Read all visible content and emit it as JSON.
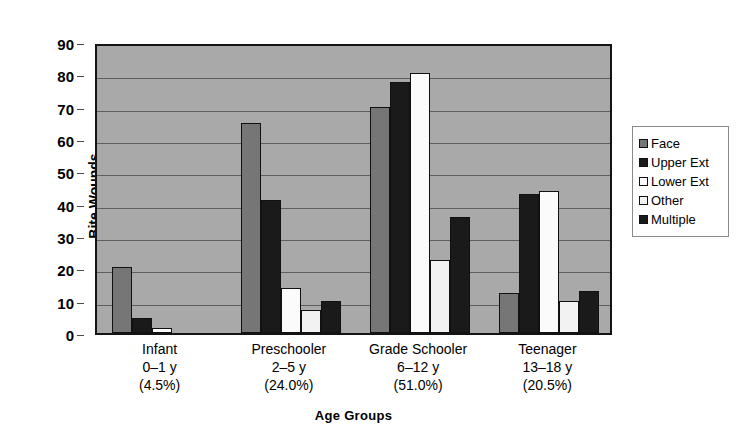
{
  "chart_data": {
    "type": "bar",
    "title": "",
    "xlabel": "Age Groups",
    "ylabel": "Bite Wounds",
    "ylim": [
      0,
      90
    ],
    "ytick_step": 10,
    "yticks": [
      90,
      80,
      70,
      60,
      50,
      40,
      30,
      20,
      10,
      0
    ],
    "grid": true,
    "legend_position": "right",
    "categories": [
      "Infant\n0–1 y\n(4.5%)",
      "Preschooler\n2–5 y\n(24.0%)",
      "Grade Schooler\n6–12 y\n(51.0%)",
      "Teenager\n13–18 y\n(20.5%)"
    ],
    "category_lines": [
      [
        "Infant",
        "0–1 y",
        "(4.5%)"
      ],
      [
        "Preschooler",
        "2–5 y",
        "(24.0%)"
      ],
      [
        "Grade Schooler",
        "6–12 y",
        "(51.0%)"
      ],
      [
        "Teenager",
        "13–18 y",
        "(20.5%)"
      ]
    ],
    "series": [
      {
        "name": "Face",
        "color": "#767676",
        "values": [
          20.5,
          65.0,
          70.0,
          12.5
        ]
      },
      {
        "name": "Upper Ext",
        "color": "#1a1a1a",
        "values": [
          4.5,
          41.0,
          77.5,
          43.0
        ]
      },
      {
        "name": "Lower Ext",
        "color": "#fbfbfb",
        "values": [
          1.5,
          14.0,
          80.5,
          44.0
        ]
      },
      {
        "name": "Other",
        "color": "#f2f2f2",
        "values": [
          0.0,
          7.0,
          22.5,
          10.0
        ]
      },
      {
        "name": "Multiple",
        "color": "#1a1a1a",
        "values": [
          0.0,
          10.0,
          36.0,
          13.0
        ]
      }
    ]
  },
  "legend": {
    "entries": [
      {
        "label": "Face",
        "swatch": "#767676"
      },
      {
        "label": "Upper Ext",
        "swatch": "#1a1a1a"
      },
      {
        "label": "Lower Ext",
        "swatch": "#fbfbfb"
      },
      {
        "label": "Other",
        "swatch": "#f2f2f2"
      },
      {
        "label": "Multiple",
        "swatch": "#1a1a1a"
      }
    ]
  },
  "axes": {
    "y_title": "Bite Wounds",
    "x_title": "Age Groups"
  },
  "colors": {
    "plot_background": "#a9a9a9",
    "gridline": "#5e5e5e",
    "axis_line": "#141414",
    "text": "#000000"
  }
}
